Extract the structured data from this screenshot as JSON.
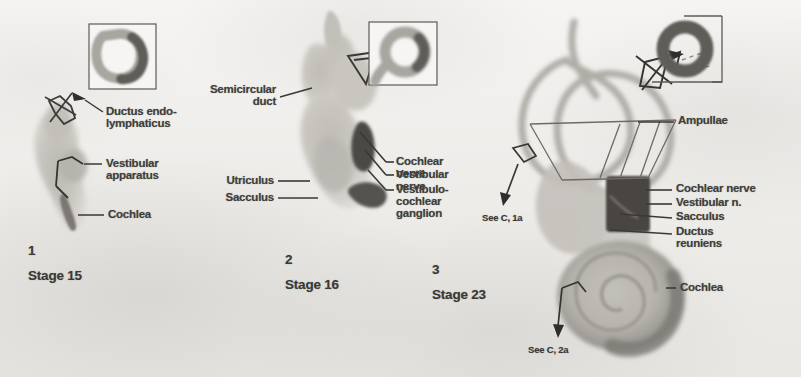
{
  "figure": {
    "kind": "anatomy-illustration",
    "background_color": "#f2f1ef",
    "ink_color": "#403f3c"
  },
  "panels": [
    {
      "id": "panel-1",
      "number": "1",
      "stage": "Stage 15",
      "labels": [
        {
          "id": "ductus-endolymphaticus",
          "text": "Ductus endo-\nlymphaticus"
        },
        {
          "id": "vestibular-apparatus",
          "text": "Vestibular\napparatus"
        },
        {
          "id": "cochlea",
          "text": "Cochlea"
        }
      ],
      "inset": {
        "id": "inset-1",
        "shape": "u-shaped-duct-cross-section"
      }
    },
    {
      "id": "panel-2",
      "number": "2",
      "stage": "Stage 16",
      "labels": [
        {
          "id": "semicircular-duct",
          "text": "Semicircular\nduct"
        },
        {
          "id": "utriculus",
          "text": "Utriculus"
        },
        {
          "id": "sacculus",
          "text": "Sacculus"
        },
        {
          "id": "cochlear-nerve",
          "text": "Cochlear nerve"
        },
        {
          "id": "vestibular-nerve",
          "text": "Vestibular nerve"
        },
        {
          "id": "vestibulocochlear-ganglion",
          "text": "Vestibulo-\ncochlear\nganglion"
        }
      ],
      "inset": {
        "id": "inset-2",
        "shape": "ring-duct-cross-section"
      }
    },
    {
      "id": "panel-3",
      "number": "3",
      "stage": "Stage 23",
      "labels": [
        {
          "id": "ampullae",
          "text": "Ampullae"
        },
        {
          "id": "cochlear-nerve",
          "text": "Cochlear nerve"
        },
        {
          "id": "vestibular-n",
          "text": "Vestibular n."
        },
        {
          "id": "sacculus",
          "text": "Sacculus"
        },
        {
          "id": "ductus-reuniens",
          "text": "Ductus\nreuniens"
        },
        {
          "id": "cochlea",
          "text": "Cochlea"
        }
      ],
      "cross_references": [
        {
          "id": "see-c-1a",
          "text": "See C, 1a"
        },
        {
          "id": "see-c-2a",
          "text": "See C, 2a"
        }
      ],
      "inset": {
        "id": "inset-3",
        "shape": "annulus-duct-cross-section"
      }
    }
  ]
}
